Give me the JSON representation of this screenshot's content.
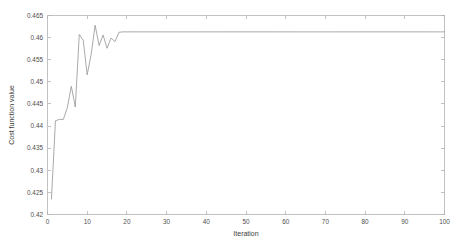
{
  "chart_data": {
    "type": "line",
    "title": "",
    "xlabel": "Iteration",
    "ylabel": "Cost function value",
    "xlim": [
      0,
      100
    ],
    "ylim": [
      0.42,
      0.465
    ],
    "xticks": [
      0,
      10,
      20,
      30,
      40,
      50,
      60,
      70,
      80,
      90,
      100
    ],
    "xtick_labels": [
      "0",
      "10",
      "20",
      "30",
      "40",
      "50",
      "60",
      "70",
      "80",
      "90",
      "100"
    ],
    "yticks": [
      0.42,
      0.425,
      0.43,
      0.435,
      0.44,
      0.445,
      0.45,
      0.455,
      0.46,
      0.465
    ],
    "ytick_labels": [
      "0.42",
      "0.425",
      "0.43",
      "0.435",
      "0.44",
      "0.445",
      "0.45",
      "0.455",
      "0.46",
      "0.465"
    ],
    "grid": false,
    "legend": null,
    "line_color": "#9a9a9a",
    "axis_color": "#b3b3b3",
    "background": "#ffffff",
    "box_axes": true,
    "ticks_direction": "in",
    "series": [
      {
        "name": "Cost function value",
        "x": [
          1,
          2,
          3,
          4,
          5,
          6,
          7,
          8,
          9,
          10,
          11,
          12,
          13,
          14,
          15,
          16,
          17,
          18,
          19,
          20,
          21,
          22,
          23,
          24,
          25,
          26,
          27,
          28,
          29,
          30,
          31,
          32,
          33,
          34,
          35,
          36,
          37,
          38,
          39,
          40,
          41,
          42,
          43,
          44,
          45,
          46,
          47,
          48,
          49,
          50,
          51,
          52,
          53,
          54,
          55,
          56,
          57,
          58,
          59,
          60,
          61,
          62,
          63,
          64,
          65,
          66,
          67,
          68,
          69,
          70,
          71,
          72,
          73,
          74,
          75,
          76,
          77,
          78,
          79,
          80,
          81,
          82,
          83,
          84,
          85,
          86,
          87,
          88,
          89,
          90,
          91,
          92,
          93,
          94,
          95,
          96,
          97,
          98,
          99,
          100
        ],
        "y": [
          0.4235,
          0.4412,
          0.4415,
          0.4415,
          0.4442,
          0.449,
          0.4443,
          0.4607,
          0.4594,
          0.4516,
          0.4562,
          0.4628,
          0.4582,
          0.4606,
          0.4576,
          0.4599,
          0.4591,
          0.4612,
          0.4613,
          0.4613,
          0.4613,
          0.4613,
          0.4613,
          0.4613,
          0.4613,
          0.4613,
          0.4613,
          0.4613,
          0.4613,
          0.4613,
          0.4613,
          0.4613,
          0.4613,
          0.4613,
          0.4613,
          0.4613,
          0.4613,
          0.4613,
          0.4613,
          0.4613,
          0.4613,
          0.4613,
          0.4613,
          0.4613,
          0.4613,
          0.4613,
          0.4613,
          0.4613,
          0.4613,
          0.4613,
          0.4613,
          0.4613,
          0.4613,
          0.4613,
          0.4613,
          0.4613,
          0.4613,
          0.4613,
          0.4613,
          0.4613,
          0.4613,
          0.4613,
          0.4613,
          0.4613,
          0.4613,
          0.4613,
          0.4613,
          0.4613,
          0.4613,
          0.4613,
          0.4613,
          0.4613,
          0.4613,
          0.4613,
          0.4613,
          0.4613,
          0.4613,
          0.4613,
          0.4613,
          0.4613,
          0.4613,
          0.4613,
          0.4613,
          0.4613,
          0.4613,
          0.4613,
          0.4613,
          0.4613,
          0.4613,
          0.4613,
          0.4613,
          0.4613,
          0.4613,
          0.4613,
          0.4613,
          0.4613,
          0.4613,
          0.4613,
          0.4613,
          0.4613
        ]
      }
    ]
  }
}
